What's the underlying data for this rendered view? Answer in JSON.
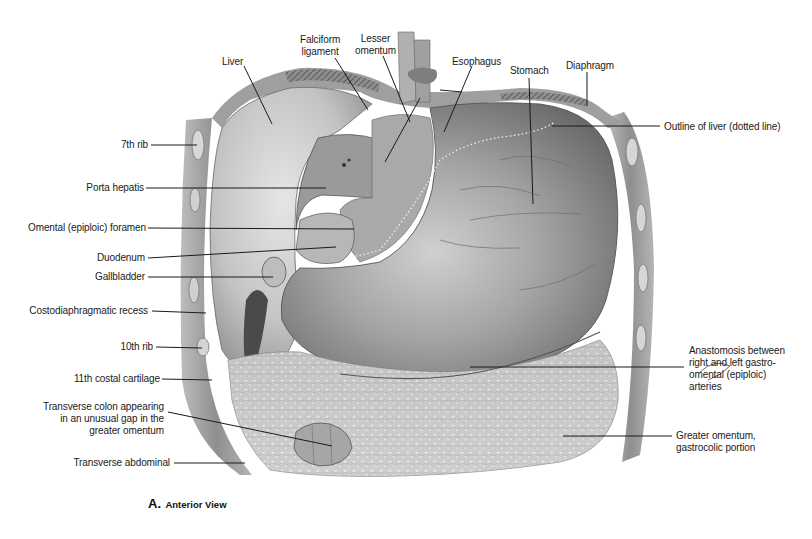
{
  "figure": {
    "caption_letter": "A.",
    "caption_text": "Anterior View",
    "view": "anterior"
  },
  "labels": {
    "liver": "Liver",
    "falciform_ligament": "Falciform\nligament",
    "lesser_omentum": "Lesser\nomentum",
    "esophagus": "Esophagus",
    "stomach": "Stomach",
    "diaphragm": "Diaphragm",
    "outline_of_liver": "Outline of liver (dotted line)",
    "rib_7th": "7th rib",
    "porta_hepatis": "Porta hepatis",
    "omental_foramen": "Omental (epiploic) foramen",
    "duodenum": "Duodenum",
    "gallbladder": "Gallbladder",
    "costodiaphragmatic_recess": "Costodiaphragmatic recess",
    "rib_10th": "10th rib",
    "costal_cartilage_11th": "11th costal cartilage",
    "transverse_colon": "Transverse colon appearing\nin an unusual gap in the\ngreater omentum",
    "transverse_abdominal": "Transverse abdominal",
    "anastomosis": "Anastomosis between\nright and left gastro-\nomental (epiploic)\narteries",
    "greater_omentum": "Greater omentum,\ngastrocolic portion"
  },
  "colors": {
    "text": "#1a1a1a",
    "leader_line": "#1a1a1a",
    "background": "#ffffff"
  }
}
